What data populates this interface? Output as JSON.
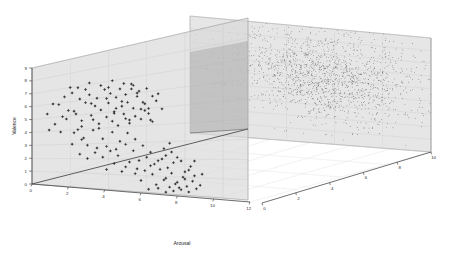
{
  "figure": {
    "background_color": "#ffffff",
    "plot_type": "3d-scatter",
    "axes": {
      "x": {
        "label": "Arousal",
        "ticks": [
          "0",
          "2",
          "4",
          "6",
          "8",
          "10",
          "12"
        ],
        "tick_values": [
          0,
          2,
          4,
          6,
          8,
          10,
          12
        ],
        "range": [
          0,
          12
        ]
      },
      "y": {
        "label": "Valence",
        "ticks": [
          "0",
          "1",
          "2",
          "3",
          "4",
          "5",
          "6",
          "7",
          "8",
          "9"
        ],
        "tick_values": [
          0,
          1,
          2,
          3,
          4,
          5,
          6,
          7,
          8,
          9
        ],
        "range": [
          0,
          9
        ]
      },
      "z": {
        "label": "",
        "ticks": [
          "0",
          "2",
          "4",
          "6",
          "8",
          "10"
        ],
        "tick_values": [
          0,
          2,
          4,
          6,
          8,
          10
        ],
        "range": [
          0,
          10
        ]
      }
    },
    "planes": {
      "front_panel_fill": "#d8d8d8",
      "back_panel_fill": "#d4d4d4",
      "overlap_fill": "#b9b9b9",
      "edge_color": "#8a8a8a",
      "grid_color": "#c9c9c9",
      "floor_grid_color": "#dddddd"
    },
    "marker_color": "#303030"
  },
  "chart_data": {
    "type": "scatter",
    "title": "",
    "xlabel": "Arousal",
    "ylabel": "Valence",
    "zlabel": "",
    "xlim": [
      0,
      12
    ],
    "ylim": [
      0,
      9
    ],
    "zlim": [
      0,
      10
    ],
    "grid": true,
    "legend": null,
    "series": [
      {
        "name": "front-plane-cluster",
        "marker": "plus",
        "color": "#303030",
        "approx_count": 150,
        "description": "Sparse points projected onto the front vertical plane (z near 0), forming two sub-groups: an upper-left group around Valence 3-7 / Arousal 2-6, and a lower-right group around Valence 0-3 / Arousal 5-9.",
        "points": [
          [
            1.4,
            5.9
          ],
          [
            1.7,
            6.4
          ],
          [
            1.9,
            5.4
          ],
          [
            2.1,
            6.6
          ],
          [
            2.3,
            5.1
          ],
          [
            2.5,
            6.1
          ],
          [
            2.6,
            4.6
          ],
          [
            2.8,
            5.8
          ],
          [
            3.0,
            6.3
          ],
          [
            3.1,
            4.9
          ],
          [
            3.3,
            5.5
          ],
          [
            3.4,
            6.0
          ],
          [
            3.5,
            4.3
          ],
          [
            3.6,
            5.2
          ],
          [
            3.8,
            6.5
          ],
          [
            3.9,
            4.7
          ],
          [
            4.0,
            5.6
          ],
          [
            4.1,
            6.2
          ],
          [
            4.2,
            4.4
          ],
          [
            4.3,
            5.0
          ],
          [
            4.4,
            5.9
          ],
          [
            4.5,
            4.1
          ],
          [
            4.6,
            6.4
          ],
          [
            4.7,
            5.3
          ],
          [
            4.8,
            4.8
          ],
          [
            4.9,
            6.0
          ],
          [
            5.0,
            5.5
          ],
          [
            5.1,
            4.2
          ],
          [
            5.2,
            6.3
          ],
          [
            5.3,
            5.1
          ],
          [
            5.4,
            4.6
          ],
          [
            5.5,
            5.8
          ],
          [
            5.6,
            6.1
          ],
          [
            5.7,
            4.4
          ],
          [
            5.8,
            5.4
          ],
          [
            5.9,
            4.9
          ],
          [
            6.0,
            6.2
          ],
          [
            6.1,
            5.0
          ],
          [
            6.2,
            4.3
          ],
          [
            6.3,
            5.7
          ],
          [
            2.2,
            3.8
          ],
          [
            2.7,
            3.4
          ],
          [
            3.2,
            3.9
          ],
          [
            3.7,
            3.3
          ],
          [
            4.2,
            3.7
          ],
          [
            4.6,
            3.1
          ],
          [
            5.0,
            3.6
          ],
          [
            5.4,
            3.2
          ],
          [
            1.2,
            4.5
          ],
          [
            1.5,
            3.9
          ],
          [
            0.9,
            4.1
          ],
          [
            2.0,
            7.0
          ],
          [
            2.4,
            6.9
          ],
          [
            3.0,
            7.1
          ],
          [
            3.6,
            6.8
          ],
          [
            4.2,
            7.0
          ],
          [
            4.8,
            6.7
          ],
          [
            5.2,
            6.6
          ],
          [
            2.9,
            2.9
          ],
          [
            3.4,
            2.7
          ],
          [
            3.9,
            2.8
          ],
          [
            4.4,
            2.6
          ],
          [
            4.9,
            2.9
          ],
          [
            5.3,
            2.5
          ],
          [
            5.8,
            2.8
          ],
          [
            6.2,
            2.4
          ],
          [
            5.6,
            1.9
          ],
          [
            6.0,
            2.1
          ],
          [
            6.4,
            1.7
          ],
          [
            6.8,
            2.0
          ],
          [
            7.1,
            1.5
          ],
          [
            7.4,
            1.8
          ],
          [
            5.9,
            1.3
          ],
          [
            6.3,
            1.1
          ],
          [
            6.7,
            1.4
          ],
          [
            7.0,
            0.9
          ],
          [
            7.3,
            1.2
          ],
          [
            7.6,
            0.7
          ],
          [
            7.9,
            1.0
          ],
          [
            6.5,
            0.5
          ],
          [
            6.9,
            0.8
          ],
          [
            7.2,
            0.4
          ],
          [
            7.5,
            0.6
          ],
          [
            7.8,
            0.3
          ],
          [
            8.1,
            0.5
          ],
          [
            8.4,
            0.8
          ],
          [
            8.0,
            1.3
          ],
          [
            8.3,
            1.6
          ],
          [
            6.1,
            0.2
          ],
          [
            6.6,
            0.3
          ],
          [
            7.0,
            0.1
          ],
          [
            7.4,
            0.2
          ],
          [
            7.7,
            0.4
          ],
          [
            8.2,
            0.2
          ],
          [
            5.7,
            0.7
          ],
          [
            5.4,
            1.1
          ],
          [
            4.9,
            1.5
          ],
          [
            5.1,
            1.8
          ],
          [
            5.5,
            1.4
          ],
          [
            6.2,
            1.6
          ],
          [
            6.6,
            1.9
          ],
          [
            7.0,
            2.2
          ],
          [
            7.3,
            2.4
          ],
          [
            7.6,
            2.1
          ],
          [
            4.5,
            2.2
          ],
          [
            4.1,
            2.5
          ],
          [
            3.7,
            2.1
          ],
          [
            3.3,
            2.4
          ],
          [
            2.9,
            2.0
          ],
          [
            2.5,
            2.3
          ],
          [
            6.9,
            2.6
          ],
          [
            7.2,
            2.9
          ],
          [
            1.8,
            4.8
          ],
          [
            2.2,
            5.3
          ],
          [
            2.6,
            4.2
          ],
          [
            3.1,
            5.7
          ],
          [
            3.5,
            4.0
          ],
          [
            4.0,
            6.6
          ],
          [
            4.4,
            5.2
          ],
          [
            4.9,
            4.5
          ],
          [
            5.3,
            6.5
          ],
          [
            5.7,
            5.0
          ],
          [
            6.1,
            4.7
          ],
          [
            6.5,
            5.4
          ],
          [
            6.8,
            4.9
          ],
          [
            2.4,
            4.0
          ],
          [
            2.8,
            6.7
          ],
          [
            3.2,
            4.6
          ],
          [
            3.9,
            5.9
          ],
          [
            4.3,
            4.9
          ],
          [
            4.7,
            5.6
          ],
          [
            5.1,
            4.4
          ],
          [
            5.5,
            6.0
          ],
          [
            5.9,
            5.3
          ],
          [
            6.3,
            4.2
          ],
          [
            6.6,
            5.8
          ],
          [
            7.8,
            1.9
          ],
          [
            8.0,
            0.9
          ],
          [
            8.5,
            1.1
          ],
          [
            8.2,
            1.4
          ],
          [
            4.7,
            1.2
          ],
          [
            4.3,
            1.7
          ],
          [
            3.9,
            1.3
          ],
          [
            8.6,
            0.4
          ],
          [
            1.1,
            6.0
          ],
          [
            1.6,
            5.0
          ],
          [
            0.8,
            5.3
          ],
          [
            2.1,
            3.0
          ],
          [
            2.6,
            3.3
          ],
          [
            8.8,
            0.6
          ],
          [
            8.5,
            1.9
          ],
          [
            8.9,
            1.2
          ]
        ]
      },
      {
        "name": "back-plane-cluster",
        "marker": "dot",
        "color": "#3a3a3a",
        "approx_count": 1500,
        "description": "Dense diffuse cloud of fine points on the back-right vertical plane, centered roughly at Valence 5-6 / depth 4-6, with a tail extending toward lower Valence and higher depth.",
        "cluster_center": [
          5.4,
          5.6
        ],
        "cluster_spread": [
          1.9,
          1.7
        ]
      }
    ]
  }
}
